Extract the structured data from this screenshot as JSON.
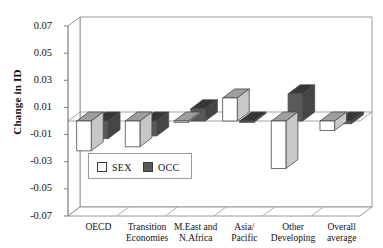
{
  "chart_data": {
    "type": "bar",
    "title": "",
    "subtitle": "",
    "xlabel": "",
    "ylabel": "Change in ID",
    "ylim": [
      -0.07,
      0.07
    ],
    "yticks": [
      0.07,
      0.05,
      0.03,
      0.01,
      -0.01,
      -0.03,
      -0.05,
      -0.07
    ],
    "ytick_labels": [
      "0.07",
      "0.05",
      "0.03",
      "0.01",
      "-0.01",
      "-0.03",
      "-0.05",
      "-0.07"
    ],
    "grid": false,
    "style": "3d-bars",
    "legend_position": "inside-lower-left",
    "categories": [
      "OECD",
      "Transition Economies",
      "M.East and N.Africa",
      "Asia/ Pacific",
      "Other Developing",
      "Overall average"
    ],
    "category_label_lines": [
      [
        "OECD"
      ],
      [
        "Transition",
        "Economies"
      ],
      [
        "M.East and",
        "N.Africa"
      ],
      [
        "Asia/",
        "Pacific"
      ],
      [
        "Other",
        "Developing"
      ],
      [
        "Overall",
        "average"
      ]
    ],
    "series": [
      {
        "name": "SEX",
        "color": "#ffffff",
        "values": [
          -0.022,
          -0.019,
          -0.001,
          0.017,
          -0.035,
          -0.007
        ]
      },
      {
        "name": "OCC",
        "color": "#595959",
        "values": [
          -0.013,
          -0.011,
          0.009,
          -0.001,
          0.02,
          -0.002
        ]
      }
    ]
  },
  "legend": {
    "items": [
      {
        "label": "SEX",
        "color": "#ffffff"
      },
      {
        "label": "OCC",
        "color": "#595959"
      }
    ]
  },
  "axis": {
    "y_title": "Change in ID"
  }
}
